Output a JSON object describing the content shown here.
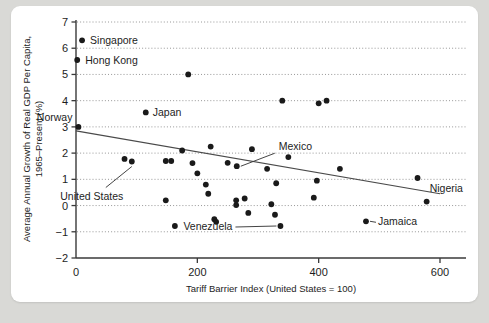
{
  "chart_data": {
    "type": "scatter",
    "title": "",
    "xlabel": "Tariff Barrier Index (United States = 100)",
    "ylabel": "Average Annual Growth of Real GDP Per Capita, 1965–Present (%)",
    "ylabel_line1": "Average Annual Growth of Real GDP Per Capita,",
    "ylabel_line2": "1965–Present (%)",
    "xlim": [
      0,
      620
    ],
    "ylim": [
      -2,
      7
    ],
    "xticks": [
      0,
      200,
      400,
      600
    ],
    "xtick_labels": [
      "0",
      "200",
      "400",
      "600"
    ],
    "yticks": [
      -2,
      -1,
      0,
      1,
      2,
      3,
      4,
      5,
      6,
      7
    ],
    "ytick_labels": [
      "−2",
      "−1",
      "0",
      "1",
      "2",
      "3",
      "4",
      "5",
      "6",
      "7"
    ],
    "grid": "horizontal-dotted",
    "legend": "none",
    "accent_color": "#1a1a1a",
    "grid_color": "#8c8c8c",
    "trendline": {
      "label": "fitted regression line",
      "x0": 0,
      "y0": 2.85,
      "x1": 600,
      "y1": 0.45
    },
    "points": [
      {
        "x": 10,
        "y": 6.3,
        "label": "Singapore"
      },
      {
        "x": 2,
        "y": 5.55,
        "label": "Hong Kong"
      },
      {
        "x": 185,
        "y": 5.0,
        "label": ""
      },
      {
        "x": 115,
        "y": 3.55,
        "label": "Japan"
      },
      {
        "x": 340,
        "y": 4.0,
        "label": ""
      },
      {
        "x": 400,
        "y": 3.9,
        "label": ""
      },
      {
        "x": 413,
        "y": 4.0,
        "label": ""
      },
      {
        "x": 4,
        "y": 3.0,
        "label": "Norway"
      },
      {
        "x": 175,
        "y": 2.1,
        "label": ""
      },
      {
        "x": 222,
        "y": 2.25,
        "label": ""
      },
      {
        "x": 290,
        "y": 2.15,
        "label": ""
      },
      {
        "x": 80,
        "y": 1.78,
        "label": ""
      },
      {
        "x": 92,
        "y": 1.68,
        "label": "United States"
      },
      {
        "x": 148,
        "y": 1.7,
        "label": ""
      },
      {
        "x": 157,
        "y": 1.7,
        "label": ""
      },
      {
        "x": 192,
        "y": 1.62,
        "label": ""
      },
      {
        "x": 250,
        "y": 1.63,
        "label": ""
      },
      {
        "x": 265,
        "y": 1.5,
        "label": "Mexico"
      },
      {
        "x": 350,
        "y": 1.85,
        "label": ""
      },
      {
        "x": 315,
        "y": 1.4,
        "label": ""
      },
      {
        "x": 435,
        "y": 1.4,
        "label": ""
      },
      {
        "x": 200,
        "y": 1.23,
        "label": ""
      },
      {
        "x": 563,
        "y": 1.05,
        "label": ""
      },
      {
        "x": 330,
        "y": 0.85,
        "label": ""
      },
      {
        "x": 214,
        "y": 0.8,
        "label": ""
      },
      {
        "x": 397,
        "y": 0.95,
        "label": ""
      },
      {
        "x": 218,
        "y": 0.45,
        "label": ""
      },
      {
        "x": 148,
        "y": 0.2,
        "label": ""
      },
      {
        "x": 264,
        "y": 0.2,
        "label": ""
      },
      {
        "x": 278,
        "y": 0.27,
        "label": ""
      },
      {
        "x": 264,
        "y": 0.02,
        "label": ""
      },
      {
        "x": 322,
        "y": 0.05,
        "label": ""
      },
      {
        "x": 392,
        "y": 0.3,
        "label": ""
      },
      {
        "x": 578,
        "y": 0.15,
        "label": "Nigeria"
      },
      {
        "x": 284,
        "y": -0.28,
        "label": ""
      },
      {
        "x": 328,
        "y": -0.35,
        "label": ""
      },
      {
        "x": 228,
        "y": -0.52,
        "label": ""
      },
      {
        "x": 231,
        "y": -0.62,
        "label": ""
      },
      {
        "x": 337,
        "y": -0.78,
        "label": "Venezuela"
      },
      {
        "x": 478,
        "y": -0.6,
        "label": "Jamaica"
      },
      {
        "x": 163,
        "y": -0.78,
        "label": ""
      }
    ],
    "annotations": [
      {
        "name": "singapore-label",
        "text": "Singapore",
        "point": {
          "x": 10,
          "y": 6.3
        },
        "leader": false
      },
      {
        "name": "hong-kong-label",
        "text": "Hong Kong",
        "point": {
          "x": 2,
          "y": 5.55
        },
        "leader": false
      },
      {
        "name": "japan-label",
        "text": "Japan",
        "point": {
          "x": 115,
          "y": 3.55
        },
        "leader": false
      },
      {
        "name": "norway-label",
        "text": "Norway",
        "point": {
          "x": 4,
          "y": 3.0
        },
        "leader": false
      },
      {
        "name": "united-states-label",
        "text": "United States",
        "point": {
          "x": 92,
          "y": 1.68
        },
        "leader": true
      },
      {
        "name": "mexico-label",
        "text": "Mexico",
        "point": {
          "x": 265,
          "y": 1.5
        },
        "leader": true
      },
      {
        "name": "venezuela-label",
        "text": "Venezuela",
        "point": {
          "x": 337,
          "y": -0.78
        },
        "leader": true
      },
      {
        "name": "jamaica-label",
        "text": "Jamaica",
        "point": {
          "x": 478,
          "y": -0.6
        },
        "leader": true
      },
      {
        "name": "nigeria-label",
        "text": "Nigeria",
        "point": {
          "x": 578,
          "y": 0.15
        },
        "leader": false
      }
    ]
  }
}
